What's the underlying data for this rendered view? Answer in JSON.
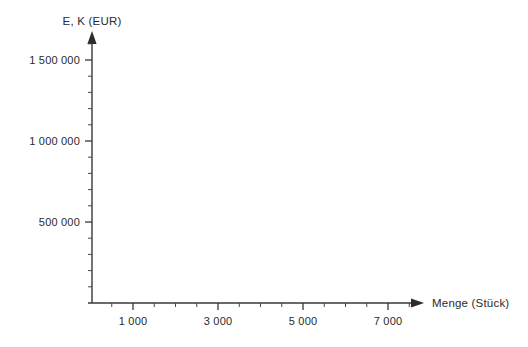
{
  "chart_data": {
    "type": "line",
    "title": "",
    "subtitle": "",
    "xlabel": "Menge (Stück)",
    "ylabel": "E, K (EUR)",
    "xlim": [
      0,
      8000
    ],
    "ylim": [
      0,
      1700000
    ],
    "grid": false,
    "legend": null,
    "series": [],
    "annotations": [],
    "note": "Empty coordinate system: axes drawn with ticks and labels, no data plotted.",
    "x_axis": {
      "label": "Menge (Stück)",
      "unit": "Stück",
      "major_tick_values": [
        1000,
        3000,
        5000,
        7000
      ],
      "major_tick_labels": [
        "1 000",
        "3 000",
        "5 000",
        "7 000"
      ],
      "minor_tick_interval": 500,
      "minor_tick_values": [
        500,
        1500,
        2000,
        2500,
        3500,
        4000,
        4500,
        5500,
        6000,
        6500,
        7500,
        8000
      ],
      "range_start": 0,
      "range_end": 8000,
      "arrow": true
    },
    "y_axis": {
      "label": "E, K (EUR)",
      "unit": "EUR",
      "major_tick_values": [
        500000,
        1000000,
        1500000
      ],
      "major_tick_labels": [
        "500 000",
        "1 000 000",
        "1 500 000"
      ],
      "minor_tick_interval": 100000,
      "minor_tick_values": [
        100000,
        200000,
        300000,
        400000,
        600000,
        700000,
        800000,
        900000,
        1100000,
        1200000,
        1300000,
        1400000,
        1600000
      ],
      "range_start": 0,
      "range_end": 1700000,
      "arrow": true
    },
    "colors": {
      "background": "#ffffff",
      "axis": "#3a3633",
      "tick": "#4a4540",
      "text": "#2b2b2b"
    }
  }
}
